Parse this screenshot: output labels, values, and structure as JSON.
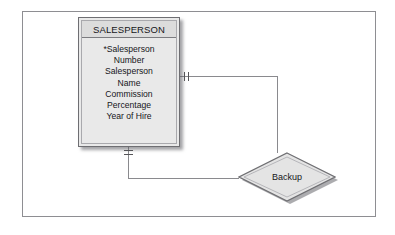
{
  "diagram": {
    "type": "entity-relationship-diagram",
    "notation": "crow-foot-style cardinality ticks",
    "entity": {
      "name": "SALESPERSON",
      "attributes": [
        "*Salesperson\nNumber",
        "Salesperson\nName",
        "Commission\nPercentage",
        "Year of Hire"
      ],
      "primary_key_marker": "*",
      "fill_color": "#e9e9e9",
      "header_color": "#dcdcdc",
      "border_color": "#6e6e72"
    },
    "relationship": {
      "name": "Backup",
      "shape": "diamond",
      "fill_color": "#e4e4e4",
      "border_color": "#6e6e72"
    },
    "connectors": [
      {
        "name": "salesperson-to-backup-upper",
        "from": "SALESPERSON right side",
        "to": "Backup top vertex",
        "cardinality": "one",
        "marker": "double vertical tick"
      },
      {
        "name": "salesperson-to-backup-lower",
        "from": "SALESPERSON bottom side",
        "to": "Backup left vertex",
        "cardinality": "one",
        "marker": "double horizontal tick"
      }
    ],
    "frame_color": "#8e8e92",
    "line_color": "#8a8a8e",
    "background_color": "#ffffff"
  }
}
